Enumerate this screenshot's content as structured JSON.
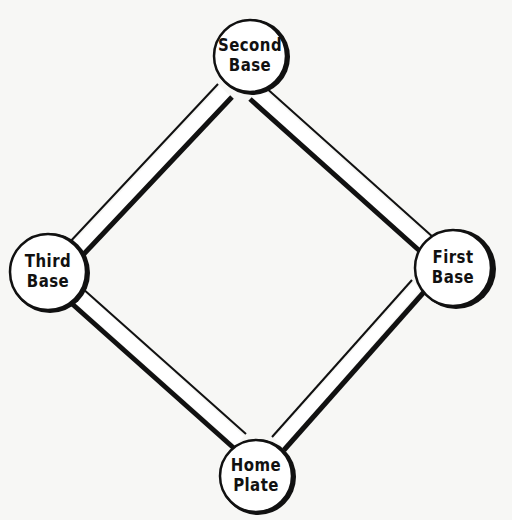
{
  "diagram": {
    "type": "baseball-infield",
    "colors": {
      "line": "#111111",
      "fill": "#ffffff",
      "background": "#f7f7f5"
    },
    "bases": [
      {
        "id": "second",
        "line1": "Second",
        "line2": "Base",
        "cx": 250,
        "cy": 56,
        "r": 38
      },
      {
        "id": "third",
        "line1": "Third",
        "line2": "Base",
        "cx": 48,
        "cy": 272,
        "r": 40
      },
      {
        "id": "first",
        "line1": "First",
        "line2": "Base",
        "cx": 454,
        "cy": 268,
        "r": 40
      },
      {
        "id": "home",
        "line1": "Home",
        "line2": "Plate",
        "cx": 256,
        "cy": 476,
        "r": 38
      }
    ],
    "paths": [
      {
        "from": "second",
        "to": "first"
      },
      {
        "from": "first",
        "to": "home"
      },
      {
        "from": "home",
        "to": "third"
      },
      {
        "from": "third",
        "to": "second"
      }
    ]
  }
}
